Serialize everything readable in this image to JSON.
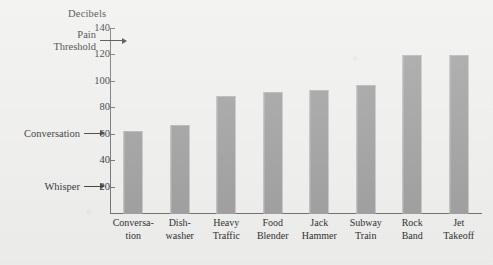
{
  "chart_data": {
    "type": "bar",
    "title": "",
    "ylabel": "Decibels",
    "xlabel": "",
    "ylim": [
      0,
      140
    ],
    "ytick_labels": [
      "20",
      "40",
      "60",
      "80",
      "100",
      "120",
      "140"
    ],
    "yticks": [
      20,
      40,
      60,
      80,
      100,
      120,
      140
    ],
    "grid": false,
    "legend": "none",
    "categories": [
      "Conversa-\ntion",
      "Dish-\nwasher",
      "Heavy\nTraffic",
      "Food\nBlender",
      "Jack\nHammer",
      "Subway\nTrain",
      "Rock\nBand",
      "Jet\nTakeoff"
    ],
    "values": [
      63,
      67,
      89,
      92,
      94,
      98,
      120,
      120
    ],
    "annotations": [
      {
        "label": "Pain\nThreshold",
        "value": 130
      },
      {
        "label": "Conversation",
        "value": 60
      },
      {
        "label": "Whisper",
        "value": 20
      }
    ]
  },
  "colors": {
    "bar": "#9d9d9d",
    "axis": "#6d6d6d",
    "text": "#2b2b2b",
    "background": "#efefed"
  }
}
